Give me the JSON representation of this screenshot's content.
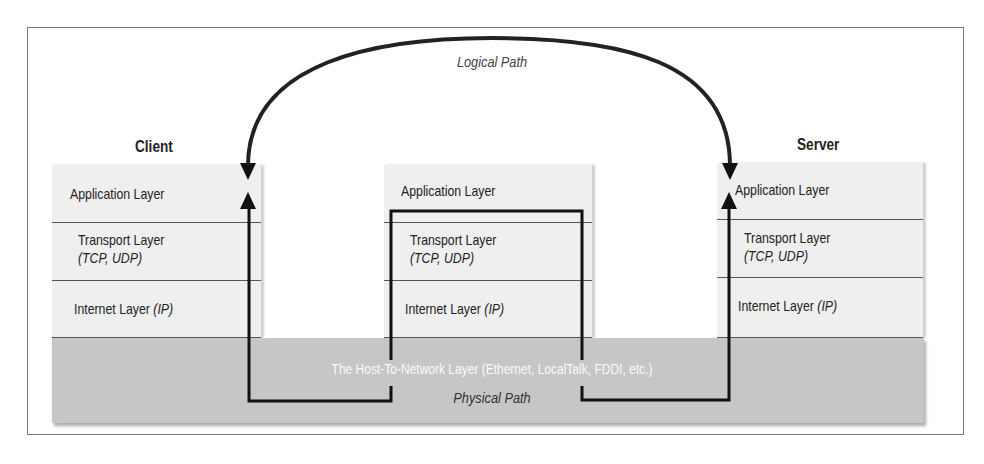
{
  "diagram": {
    "logical_path_label": "Logical Path",
    "physical_path_label": "Physical Path",
    "host_to_network_label": "The Host-To-Network Layer (Ethernet, LocalTalk, FDDI, etc.)",
    "client": {
      "title": "Client",
      "layers": [
        {
          "name": "Application Layer",
          "sub": ""
        },
        {
          "name": "Transport Layer",
          "sub": "(TCP, UDP)"
        },
        {
          "name": "Internet Layer ",
          "sub": "(IP)"
        }
      ]
    },
    "router": {
      "layers": [
        {
          "name": "Application Layer",
          "sub": ""
        },
        {
          "name": "Transport Layer",
          "sub": "(TCP, UDP)"
        },
        {
          "name": "Internet Layer ",
          "sub": "(IP)"
        }
      ]
    },
    "server": {
      "title": "Server",
      "layers": [
        {
          "name": "Application Layer",
          "sub": ""
        },
        {
          "name": "Transport Layer",
          "sub": "(TCP, UDP)"
        },
        {
          "name": "Internet Layer ",
          "sub": "(IP)"
        }
      ]
    }
  }
}
